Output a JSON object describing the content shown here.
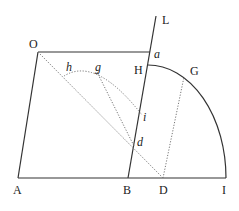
{
  "figure": {
    "points": {
      "O": {
        "label": "O",
        "x": 38,
        "y": 52
      },
      "A": {
        "label": "A",
        "x": 18,
        "y": 178
      },
      "B": {
        "label": "B",
        "x": 128,
        "y": 178
      },
      "D": {
        "label": "D",
        "x": 163,
        "y": 178
      },
      "I": {
        "label": "I",
        "x": 226,
        "y": 178
      },
      "L": {
        "label": "L",
        "x": 156,
        "y": 16
      },
      "a": {
        "label": "a",
        "x": 150,
        "y": 52
      },
      "H": {
        "label": "H",
        "x": 148,
        "y": 65
      },
      "G": {
        "label": "G",
        "x": 184,
        "y": 77
      },
      "i": {
        "label": "i",
        "x": 142,
        "y": 115
      },
      "d": {
        "label": "d",
        "x": 134,
        "y": 146
      },
      "h": {
        "label": "h",
        "x": 64,
        "y": 76
      },
      "g": {
        "label": "g",
        "x": 97,
        "y": 72
      }
    },
    "labels": {
      "O": "O",
      "A": "A",
      "B": "B",
      "D": "D",
      "I": "I",
      "L": "L",
      "a": "a",
      "H": "H",
      "G": "G",
      "i": "i",
      "d": "d",
      "h": "h",
      "g": "g"
    },
    "colors": {
      "solid": "#333333",
      "dotted": "#777777"
    }
  }
}
